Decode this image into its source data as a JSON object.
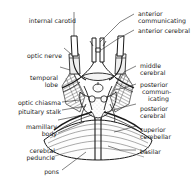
{
  "figure": {
    "style": "pen-and-ink anatomical line drawing",
    "ink_color": "#1a1a1a",
    "background_color": "#ffffff"
  },
  "labels": {
    "internal_carotid": "internal carotid",
    "optic_nerve": "optic nerve",
    "temporal_lobe_1": "temporal",
    "temporal_lobe_2": "lobe",
    "optic_chiasma": "optic chiasma",
    "pituitary_stalk": "pituitary stalk",
    "mamillary_1": "mamillary",
    "mamillary_2": "body",
    "cerebral_peduncle_1": "cerebral",
    "cerebral_peduncle_2": "peduncle",
    "pons": "pons",
    "anterior_communicating_1": "anterior",
    "anterior_communicating_2": "communicating",
    "anterior_cerebral": "anterior cerebral",
    "middle_cerebral_1": "middle",
    "middle_cerebral_2": "cerebral",
    "posterior_communicating_1": "posterior",
    "posterior_communicating_2": "commun-",
    "posterior_communicating_3": "icating",
    "posterior_cerebral_1": "posterior",
    "posterior_cerebral_2": "cerebral",
    "superior_cerebellar_1": "superior",
    "superior_cerebellar_2": "cerebellar",
    "basilar": "basilar"
  },
  "structures": [
    "internal carotid",
    "optic nerve",
    "temporal lobe",
    "optic chiasma",
    "pituitary stalk",
    "mamillary body",
    "cerebral peduncle",
    "pons",
    "anterior communicating",
    "anterior cerebral",
    "middle cerebral",
    "posterior communicating",
    "posterior cerebral",
    "superior cerebellar",
    "basilar"
  ]
}
